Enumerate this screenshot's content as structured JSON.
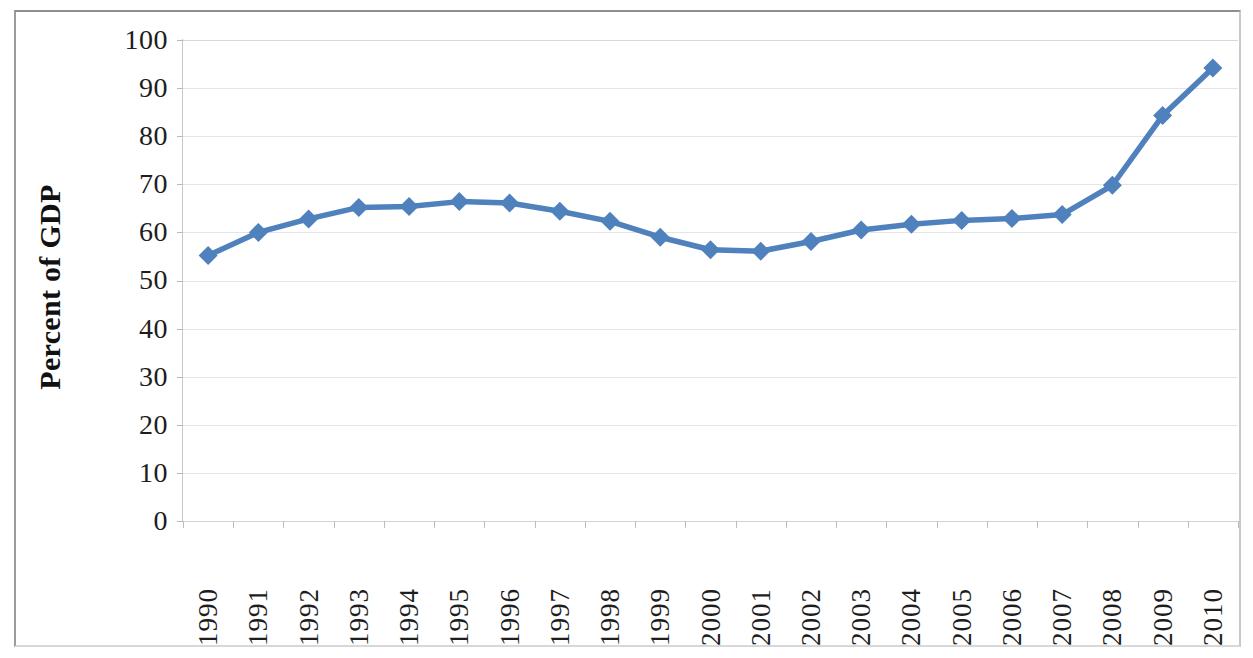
{
  "chart_data": {
    "type": "line",
    "title": "",
    "subtitle": "",
    "xlabel": "",
    "ylabel": "Percent of GDP",
    "ylim": [
      0,
      100
    ],
    "ytick_step": 10,
    "yticks": [
      100,
      90,
      80,
      70,
      60,
      50,
      40,
      30,
      20,
      10,
      0
    ],
    "grid": true,
    "legend": "none",
    "categories": [
      "1990",
      "1991",
      "1992",
      "1993",
      "1994",
      "1995",
      "1996",
      "1997",
      "1998",
      "1999",
      "2000",
      "2001",
      "2002",
      "2003",
      "2004",
      "2005",
      "2006",
      "2007",
      "2008",
      "2009",
      "2010"
    ],
    "series": [
      {
        "name": "Percent of GDP",
        "color": "#4f81bd",
        "marker": "diamond",
        "values": [
          55.2,
          60.0,
          62.8,
          65.2,
          65.4,
          66.4,
          66.1,
          64.4,
          62.3,
          59.0,
          56.4,
          56.1,
          58.1,
          60.5,
          61.7,
          62.5,
          62.9,
          63.7,
          69.8,
          84.3,
          94.2
        ]
      }
    ]
  },
  "axes": {
    "y_title": "Percent of GDP"
  },
  "style": {
    "series_color": "#4f81bd",
    "gridline_color": "#e2e6ea",
    "axis_color": "#c3c8cd",
    "text_color": "#1d1d1d",
    "frame_color": "#b9b9b9",
    "background": "#ffffff"
  }
}
